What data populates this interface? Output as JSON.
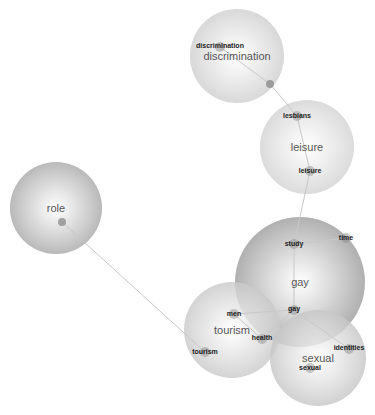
{
  "diagram": {
    "type": "network-cluster-map",
    "clusters": [
      {
        "id": "discrimination",
        "label": "discrimination",
        "cx": 237,
        "cy": 56,
        "r": 47,
        "fill": "#cfcfcf",
        "label_size": 11
      },
      {
        "id": "leisure",
        "label": "leisure",
        "cx": 307,
        "cy": 147,
        "r": 47,
        "fill": "#d3d3d3",
        "label_size": 11
      },
      {
        "id": "role",
        "label": "role",
        "cx": 56,
        "cy": 208,
        "r": 46,
        "fill": "#a9a9a9",
        "label_size": 11
      },
      {
        "id": "gay",
        "label": "gay",
        "cx": 300,
        "cy": 282,
        "r": 65,
        "fill": "#9d9d9d",
        "label_size": 11
      },
      {
        "id": "tourism",
        "label": "tourism",
        "cx": 232,
        "cy": 330,
        "r": 48,
        "fill": "#c9c9c9",
        "label_size": 11
      },
      {
        "id": "sexual",
        "label": "sexual",
        "cx": 318,
        "cy": 358,
        "r": 48,
        "fill": "#c6c6c6",
        "label_size": 11
      }
    ],
    "nodes": [
      {
        "id": "n-discrimination",
        "label": "discrimination",
        "x": 220,
        "y": 47,
        "cluster": "discrimination",
        "label_dx": 0,
        "label_dy": -2
      },
      {
        "id": "n-disc-dot",
        "label": "",
        "x": 270,
        "y": 84,
        "cluster": "discrimination",
        "label_dx": 0,
        "label_dy": 0
      },
      {
        "id": "n-lesbians",
        "label": "lesbians",
        "x": 297,
        "y": 116,
        "cluster": "leisure",
        "label_dx": 0,
        "label_dy": -1
      },
      {
        "id": "n-leisure",
        "label": "leisure",
        "x": 310,
        "y": 171,
        "cluster": "leisure",
        "label_dx": 0,
        "label_dy": -1
      },
      {
        "id": "n-study",
        "label": "study",
        "x": 294,
        "y": 244,
        "cluster": "gay",
        "label_dx": 0,
        "label_dy": -1
      },
      {
        "id": "n-time",
        "label": "time",
        "x": 346,
        "y": 238,
        "cluster": "gay",
        "label_dx": 0,
        "label_dy": -1
      },
      {
        "id": "n-gay",
        "label": "gay",
        "x": 294,
        "y": 310,
        "cluster": "gay",
        "label_dx": 0,
        "label_dy": -2
      },
      {
        "id": "n-men",
        "label": "men",
        "x": 234,
        "y": 314,
        "cluster": "tourism",
        "label_dx": 0,
        "label_dy": -1
      },
      {
        "id": "n-health",
        "label": "health",
        "x": 262,
        "y": 339,
        "cluster": "tourism",
        "label_dx": 0,
        "label_dy": -2
      },
      {
        "id": "n-tourism",
        "label": "tourism",
        "x": 205,
        "y": 352,
        "cluster": "tourism",
        "label_dx": 0,
        "label_dy": -1
      },
      {
        "id": "n-identities",
        "label": "identities",
        "x": 349,
        "y": 349,
        "cluster": "sexual",
        "label_dx": 0,
        "label_dy": -2
      },
      {
        "id": "n-sexual",
        "label": "sexual",
        "x": 310,
        "y": 368,
        "cluster": "sexual",
        "label_dx": 0,
        "label_dy": -1
      },
      {
        "id": "n-role",
        "label": "",
        "x": 62,
        "y": 222,
        "cluster": "role",
        "label_dx": 0,
        "label_dy": 0
      }
    ],
    "edges": [
      {
        "from": "n-role",
        "to": "n-tourism"
      },
      {
        "from": "n-disc-dot",
        "to": "n-lesbians"
      },
      {
        "from": "n-lesbians",
        "to": "n-leisure"
      },
      {
        "from": "n-leisure",
        "to": "n-study"
      },
      {
        "from": "n-study",
        "to": "n-time"
      },
      {
        "from": "n-study",
        "to": "n-gay"
      },
      {
        "from": "n-gay",
        "to": "n-men"
      },
      {
        "from": "n-gay",
        "to": "n-health"
      },
      {
        "from": "n-gay",
        "to": "n-identities"
      },
      {
        "from": "n-men",
        "to": "n-health"
      },
      {
        "from": "n-discrimination",
        "to": "n-disc-dot"
      }
    ],
    "colors": {
      "edge": "#c8c8c8",
      "node_dot": "#888888",
      "background": "#ffffff"
    }
  }
}
